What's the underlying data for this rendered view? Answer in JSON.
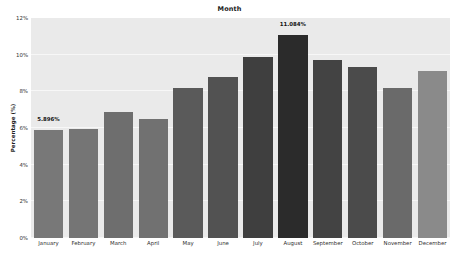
{
  "chart_data": {
    "type": "bar",
    "title": "Month",
    "xlabel": "",
    "ylabel": "Percentage (%)",
    "categories": [
      "January",
      "February",
      "March",
      "April",
      "May",
      "June",
      "July",
      "August",
      "September",
      "October",
      "November",
      "December"
    ],
    "values": [
      5.896,
      5.95,
      6.9,
      6.5,
      8.2,
      8.8,
      9.9,
      11.084,
      9.7,
      9.35,
      8.2,
      9.1
    ],
    "ylim": [
      0,
      12
    ],
    "yticks": [
      0,
      2,
      4,
      6,
      8,
      10,
      12
    ],
    "ytick_labels": [
      "0%",
      "2%",
      "4%",
      "6%",
      "8%",
      "10%",
      "12%"
    ],
    "grid": true,
    "legend": false,
    "annotations": [
      {
        "category": "January",
        "text": "5.896%"
      },
      {
        "category": "August",
        "text": "11.084%"
      }
    ],
    "bar_colors": [
      "#787878",
      "#757575",
      "#6e6e6e",
      "#717171",
      "#5a5a5a",
      "#525252",
      "#3f3f3f",
      "#2b2b2b",
      "#434343",
      "#4b4b4b",
      "#6a6a6a",
      "#8a8a8a"
    ],
    "plot_background": "#eaeaea",
    "gridline_color": "#f7f7f7",
    "figure_background": "#ffffff"
  }
}
